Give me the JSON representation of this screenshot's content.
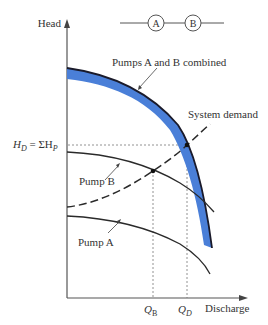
{
  "axes": {
    "y_label": "Head",
    "x_label": "Discharge"
  },
  "schematic": {
    "pump_a": "A",
    "pump_b": "B",
    "arrangement": "series"
  },
  "labels": {
    "combined": "Pumps A and B combined",
    "system": "System demand",
    "pump_b": "Pump B",
    "pump_a": "Pump A",
    "hd_main": "H",
    "hd_sub": "D",
    "hd_eq": " = ΣH",
    "hd_sub2": "P",
    "qb_main": "Q",
    "qb_sub": "B",
    "qd_main": "Q",
    "qd_sub": "D"
  },
  "colors": {
    "combined_band": "#4a7fd8",
    "curve": "#222222",
    "axis": "#555555",
    "guide": "#666666"
  }
}
